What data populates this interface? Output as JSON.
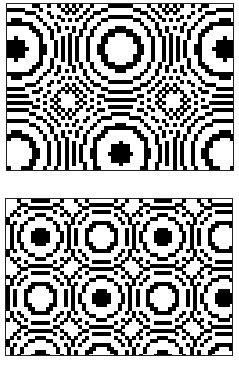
{
  "figure": {
    "colors": {
      "ink": "#000000",
      "paper": "#ffffff",
      "frame": "#222222"
    },
    "panels": [
      {
        "name": "top-pattern",
        "x": 6,
        "y": 3,
        "width": 228,
        "height": 168,
        "cell": 3.6,
        "period_cells": 29,
        "origin_cells": [
          -2,
          -12
        ],
        "threshold": 0.55
      },
      {
        "name": "bottom-pattern",
        "x": 5,
        "y": 198,
        "width": 228,
        "height": 158,
        "cell": 3.6,
        "period_cells": 17,
        "origin_cells": [
          8,
          7
        ],
        "threshold": 0.55
      }
    ]
  }
}
